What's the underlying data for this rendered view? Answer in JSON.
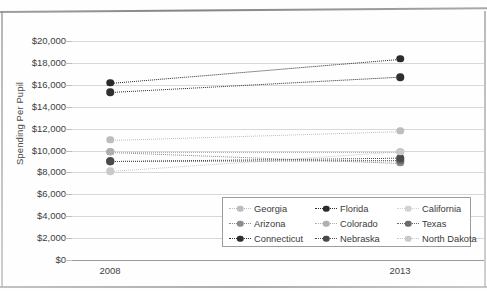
{
  "chart_data": {
    "type": "line",
    "title": "",
    "xlabel": "",
    "ylabel": "Spending Per Pupil",
    "categories": [
      "2008",
      "2013"
    ],
    "ylim": [
      0,
      20000
    ],
    "ytick_step": 2000,
    "ytick_labels": [
      "$20,000",
      "$18,000",
      "$16,000",
      "$14,000",
      "$12,000",
      "$10,000",
      "$8,000",
      "$6,000",
      "$4,000",
      "$2,000",
      "$0"
    ],
    "ytick_values": [
      20000,
      18000,
      16000,
      14000,
      12000,
      10000,
      8000,
      6000,
      4000,
      2000,
      0
    ],
    "grid": true,
    "legend_position": "inside-bottom-right",
    "legend_columns": 3,
    "line_style": "dotted",
    "marker": "circle",
    "series": [
      {
        "name": "Georgia",
        "values": [
          11000,
          11800
        ],
        "color": "#bdbdbd"
      },
      {
        "name": "Florida",
        "values": [
          16200,
          18400
        ],
        "color": "#2b2b2b"
      },
      {
        "name": "California",
        "values": [
          9000,
          9000
        ],
        "color": "#d2d2d2"
      },
      {
        "name": "Arizona",
        "values": [
          9900,
          8900
        ],
        "color": "#8c8c8c"
      },
      {
        "name": "Colorado",
        "values": [
          9900,
          9900
        ],
        "color": "#b0b0b0"
      },
      {
        "name": "Texas",
        "values": [
          9000,
          9100
        ],
        "color": "#6b6b6b"
      },
      {
        "name": "Connecticut",
        "values": [
          15300,
          16700
        ],
        "color": "#2f2f2f"
      },
      {
        "name": "Nebraska",
        "values": [
          9000,
          9300
        ],
        "color": "#4a4a4a"
      },
      {
        "name": "North Dakota",
        "values": [
          8100,
          9900
        ],
        "color": "#c9c9c9"
      }
    ]
  },
  "legend": {
    "entries": [
      {
        "label": "Georgia"
      },
      {
        "label": "Florida"
      },
      {
        "label": "California"
      },
      {
        "label": "Arizona"
      },
      {
        "label": "Colorado"
      },
      {
        "label": "Texas"
      },
      {
        "label": "Connecticut"
      },
      {
        "label": "Nebraska"
      },
      {
        "label": "North Dakota"
      }
    ]
  },
  "colors": {
    "grid": "#d8d8d8",
    "axis": "#9b9b9b",
    "text": "#3c3c3c",
    "background": "#fefefe"
  }
}
